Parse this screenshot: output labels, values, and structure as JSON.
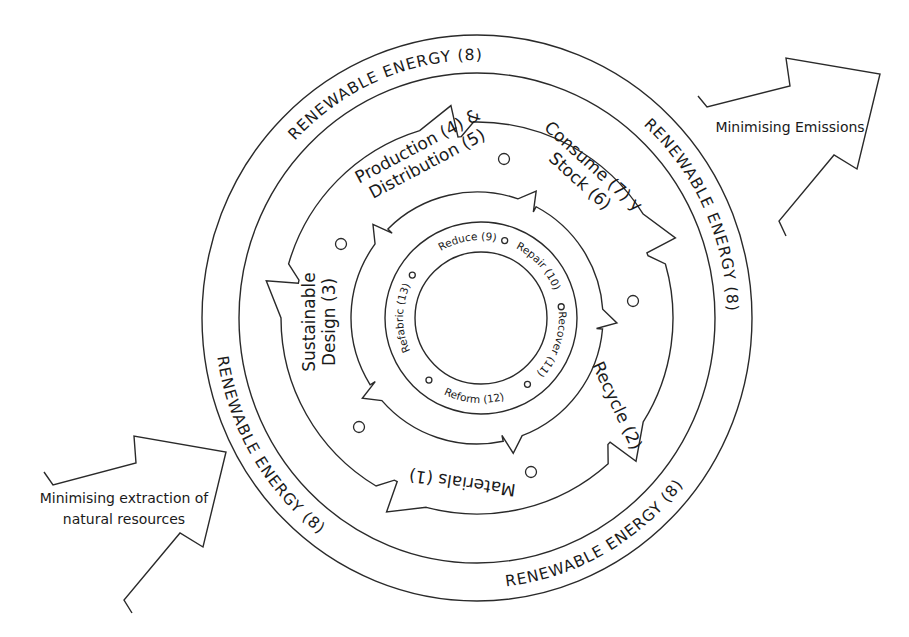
{
  "diagram": {
    "colors": {
      "stroke": "#2a2a2a",
      "text": "#1a1a1a",
      "background": "#ffffff"
    },
    "geometry": {
      "center": [
        477,
        318
      ],
      "outer_ring": {
        "rx": 275,
        "ry": 283
      },
      "inner_ring": {
        "rx": 238,
        "ry": 245
      },
      "band_outer_r": 196,
      "band_inner_r": 126,
      "core_ring": {
        "cx": 481,
        "cy": 318,
        "r_outer": 96,
        "r_inner": 66
      }
    },
    "outer_band": {
      "label": "RENEWABLE ENERGY (8)",
      "labels": [
        {
          "text": "RENEWABLE  ENERGY  (8)",
          "start_deg": 205,
          "end_deg": 290
        },
        {
          "text": "RENEWABLE  ENERGY  (8)",
          "start_deg": 298,
          "end_deg": 372
        },
        {
          "text": "RENEWABLE  ENERGY  (8)",
          "start_deg": 22,
          "end_deg": 100,
          "flip": true
        },
        {
          "text": "RENEWABLE  ENERGY  (8)",
          "start_deg": 108,
          "end_deg": 190,
          "flip": true
        }
      ]
    },
    "stages": [
      {
        "id": "production",
        "lines": [
          "Production (4) &",
          "Distribution (5)"
        ],
        "x": 425,
        "y": 160,
        "rotate": -28
      },
      {
        "id": "consume",
        "lines": [
          "Consume (7) y",
          "Stock (6)"
        ],
        "x": 583,
        "y": 178,
        "rotate": 42
      },
      {
        "id": "recycle",
        "lines": [
          "Recycle (2)"
        ],
        "x": 612,
        "y": 408,
        "rotate": 65
      },
      {
        "id": "materials",
        "lines": [
          "Materials (1)"
        ],
        "x": 463,
        "y": 477,
        "rotate": 188
      },
      {
        "id": "design",
        "lines": [
          "Sustainable",
          "Design (3)"
        ],
        "x": 325,
        "y": 322,
        "rotate": -90
      }
    ],
    "stage_dots": [
      {
        "x": 504,
        "y": 159
      },
      {
        "x": 633,
        "y": 301
      },
      {
        "x": 531,
        "y": 472
      },
      {
        "x": 359,
        "y": 427
      },
      {
        "x": 341,
        "y": 244
      }
    ],
    "band_arrows": {
      "tip_angles_deg": [
        -97,
        -22,
        42,
        115,
        190
      ],
      "notch_angles_deg": [
        -62,
        5,
        78,
        148,
        225
      ]
    },
    "inner_actions": {
      "labels": [
        {
          "text": "Reduce (9)",
          "angle_deg": -100
        },
        {
          "text": "Repair (10)",
          "angle_deg": -42
        },
        {
          "text": "Recover (11)",
          "angle_deg": 20,
          "flip": false
        },
        {
          "text": "Reform (12)",
          "angle_deg": 95,
          "flip": true
        },
        {
          "text": "Refabric (13)",
          "angle_deg": 180
        }
      ],
      "dots_deg": [
        -73,
        -8,
        55,
        130,
        212
      ]
    },
    "arrows": [
      {
        "id": "emissions",
        "label_lines": [
          "Minimising Emissions"
        ],
        "label_x": 790,
        "label_y": 132,
        "points": "698,96 707,107 790,86 786,58 880,74 857,169 834,155 779,221 786,236"
      },
      {
        "id": "extraction",
        "label_lines": [
          "Minimising extraction of",
          "natural resources"
        ],
        "label_x": 124,
        "label_y": 503,
        "points": "44,472 53,485 136,463 134,436 226,452 203,547 180,533 124,600 132,613"
      }
    ]
  }
}
